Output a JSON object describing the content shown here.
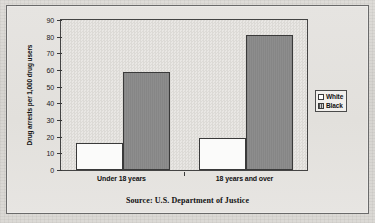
{
  "chart_data": {
    "type": "bar",
    "title": "",
    "subtitle": "",
    "xlabel": "",
    "ylabel": "Drug arrests per 1,000 drug users",
    "categories": [
      "Under 18 years",
      "18 years and over"
    ],
    "series": [
      {
        "name": "White",
        "values": [
          16,
          19
        ],
        "color": "#ffffff"
      },
      {
        "name": "Black",
        "values": [
          59,
          81
        ],
        "color": "#8d8d8d"
      }
    ],
    "ylim": [
      0,
      90
    ],
    "ytick_step": 10,
    "yticks": [
      0,
      10,
      20,
      30,
      40,
      50,
      60,
      70,
      80,
      90
    ],
    "ytick_labels": [
      "0",
      "10",
      "20",
      "30",
      "40",
      "50",
      "60",
      "70",
      "80",
      "90"
    ],
    "grid": false,
    "legend_position": "right",
    "legend_entries": [
      "White",
      "Black"
    ],
    "annotations": [
      "Source: U.S. Department of Justice"
    ]
  },
  "caption": {
    "source": "Source: U.S. Department of Justice"
  }
}
